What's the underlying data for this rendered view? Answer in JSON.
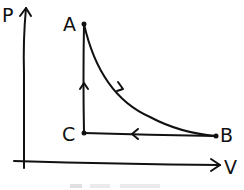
{
  "diagram": {
    "type": "PV cycle",
    "axes": {
      "y_label": "P",
      "x_label": "V"
    },
    "points": [
      {
        "name": "A",
        "label": "A"
      },
      {
        "name": "B",
        "label": "B"
      },
      {
        "name": "C",
        "label": "C"
      }
    ],
    "paths": [
      {
        "from": "A",
        "to": "B",
        "shape": "curve"
      },
      {
        "from": "B",
        "to": "C",
        "shape": "horizontal line"
      },
      {
        "from": "C",
        "to": "A",
        "shape": "vertical line"
      }
    ],
    "stroke_color": "#111111"
  }
}
